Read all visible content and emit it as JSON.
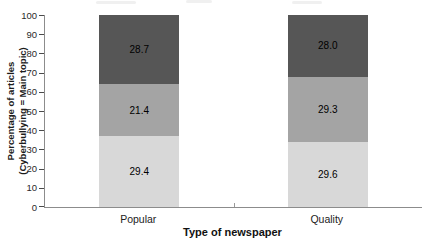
{
  "chart_data": {
    "type": "bar",
    "stacked": true,
    "normalized_to_100_percent": true,
    "title": "",
    "xlabel": "Type of newspaper",
    "ylabel_line1": "Percentage of articles",
    "ylabel_line2": "(Cyberbullying = Main topic)",
    "categories": [
      "Popular",
      "Quality"
    ],
    "series": [
      {
        "name": "bottom-segment",
        "color": "#d8d8d8",
        "values": [
          29.4,
          29.6
        ]
      },
      {
        "name": "middle-segment",
        "color": "#a4a4a4",
        "values": [
          21.4,
          29.3
        ]
      },
      {
        "name": "top-segment",
        "color": "#565656",
        "values": [
          28.7,
          28.0
        ]
      }
    ],
    "y_ticks": [
      0,
      10,
      20,
      30,
      40,
      50,
      60,
      70,
      80,
      90,
      100
    ],
    "ylim": [
      0,
      100
    ],
    "grid": "off",
    "legend": "none",
    "value_label_decimals": 1
  },
  "colors": {
    "axis": "#8c8c8c",
    "tick": "#4a4a4a",
    "text": "#1c1c1c",
    "background": "#ffffff"
  }
}
